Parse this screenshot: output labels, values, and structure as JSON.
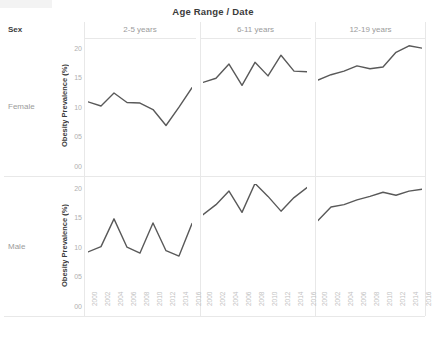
{
  "header": {
    "column_header_title": "Age Range / Date",
    "row_header_title": "Sex"
  },
  "rows": [
    {
      "label": "Female"
    },
    {
      "label": "Male"
    }
  ],
  "columns": [
    {
      "label": "2-5 years"
    },
    {
      "label": "6-11 years"
    },
    {
      "label": "12-19 years"
    }
  ],
  "axis": {
    "y_title": "Obesity Prevalence (%)",
    "y_ticks": [
      "00",
      "05",
      "10",
      "15",
      "20"
    ],
    "y_tick_values": [
      0,
      5,
      10,
      15,
      20
    ],
    "x_ticks": [
      "2000",
      "2002",
      "2004",
      "2006",
      "2008",
      "2010",
      "2012",
      "2014",
      "2016"
    ],
    "line_color": "#595959"
  },
  "chart_data": {
    "type": "line",
    "title": "Age Range / Date",
    "xlabel": "",
    "ylabel": "Obesity Prevalence (%)",
    "xlim": [
      2000,
      2016
    ],
    "ylim": [
      0,
      21
    ],
    "grid": false,
    "legend": "none",
    "facet_rows": [
      "Female",
      "Male"
    ],
    "facet_cols": [
      "2-5 years",
      "6-11 years",
      "12-19 years"
    ],
    "x": [
      2000,
      2001,
      2002,
      2003,
      2004,
      2005,
      2006,
      2007,
      2008,
      2009,
      2010,
      2011,
      2012,
      2013,
      2014,
      2015,
      2016
    ],
    "panels": [
      {
        "sex": "Female",
        "age_range": "2-5 years",
        "x": [
          2000,
          2002,
          2004,
          2006,
          2008,
          2010,
          2012,
          2014,
          2016
        ],
        "values": [
          11.2,
          10.5,
          12.7,
          11.1,
          11.0,
          9.9,
          7.2,
          10.3,
          13.6
        ]
      },
      {
        "sex": "Female",
        "age_range": "6-11 years",
        "x": [
          2000,
          2002,
          2004,
          2006,
          2008,
          2010,
          2012,
          2014,
          2016
        ],
        "values": [
          14.5,
          15.2,
          17.6,
          14.0,
          17.9,
          15.6,
          19.1,
          16.4,
          16.3
        ]
      },
      {
        "sex": "Female",
        "age_range": "12-19 years",
        "x": [
          2000,
          2002,
          2004,
          2006,
          2008,
          2010,
          2012,
          2014,
          2016
        ],
        "values": [
          14.9,
          15.8,
          16.4,
          17.3,
          16.8,
          17.1,
          19.6,
          20.7,
          20.3
        ]
      },
      {
        "sex": "Male",
        "age_range": "2-5 years",
        "x": [
          2000,
          2002,
          2004,
          2006,
          2008,
          2010,
          2012,
          2014,
          2016
        ],
        "values": [
          9.5,
          10.4,
          15.1,
          10.3,
          9.3,
          14.4,
          9.7,
          8.8,
          14.3
        ]
      },
      {
        "sex": "Male",
        "age_range": "6-11 years",
        "x": [
          2000,
          2002,
          2004,
          2006,
          2008,
          2010,
          2012,
          2014,
          2016
        ],
        "values": [
          15.8,
          17.5,
          19.8,
          16.2,
          21.1,
          18.9,
          16.4,
          18.7,
          20.4
        ]
      },
      {
        "sex": "Male",
        "age_range": "12-19 years",
        "x": [
          2000,
          2002,
          2004,
          2006,
          2008,
          2010,
          2012,
          2014,
          2016
        ],
        "values": [
          14.8,
          17.1,
          17.5,
          18.3,
          18.9,
          19.6,
          19.1,
          19.8,
          20.1
        ]
      }
    ]
  }
}
